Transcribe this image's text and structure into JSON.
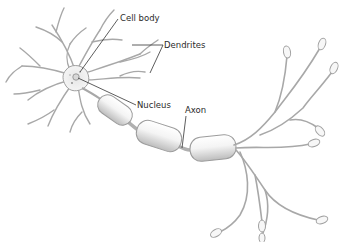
{
  "diagram": {
    "labels": {
      "cell_body": "Cell body",
      "dendrites": "Dendrites",
      "nucleus": "Nucleus",
      "axon": "Axon"
    },
    "colors": {
      "background": "#ffffff",
      "outline": "#9a9a9a",
      "fill": "#f2f2f2",
      "shade": "#cfcfcf",
      "leader_line": "#333333",
      "text": "#2b2b2b"
    }
  }
}
